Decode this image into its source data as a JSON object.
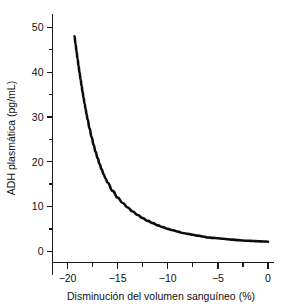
{
  "chart_data": {
    "type": "line",
    "title": "",
    "xlabel": "Disminución del volumen sanguíneo (%)",
    "ylabel": "ADH plasmática (pg/mL)",
    "xlim": [
      -21.5,
      0.6
    ],
    "ylim": [
      -2.5,
      53
    ],
    "grid": false,
    "legend": null,
    "xticks": [
      -20,
      -15,
      -10,
      -5,
      0
    ],
    "xticklabels": [
      "−20",
      "−15",
      "−10",
      "−5",
      "0"
    ],
    "xminorticks": [
      -17.5,
      -12.5,
      -7.5,
      -2.5
    ],
    "yticks": [
      0,
      10,
      20,
      30,
      40,
      50
    ],
    "yticklabels": [
      "0",
      "10",
      "20",
      "30",
      "40",
      "50"
    ],
    "yminorticks": [
      5,
      15,
      25,
      35,
      45
    ],
    "series": [
      {
        "name": "ADH plasmática",
        "color": "#0d0d0d",
        "x": [
          -19.3,
          -19.2,
          -19.1,
          -19.0,
          -18.9,
          -18.8,
          -18.7,
          -18.6,
          -18.5,
          -18.4,
          -18.3,
          -18.2,
          -18.1,
          -18.0,
          -17.8,
          -17.6,
          -17.4,
          -17.2,
          -17.0,
          -16.8,
          -16.6,
          -16.4,
          -16.2,
          -16.0,
          -15.5,
          -15.0,
          -14.5,
          -14.0,
          -13.5,
          -13.0,
          -12.5,
          -12.0,
          -11.5,
          -11.0,
          -10.5,
          -10.0,
          -9.5,
          -9.0,
          -8.5,
          -8.0,
          -7.5,
          -7.0,
          -6.5,
          -6.0,
          -5.5,
          -5.0,
          -4.5,
          -4.0,
          -3.5,
          -3.0,
          -2.5,
          -2.0,
          -1.5,
          -1.0,
          -0.5,
          0.0
        ],
        "y": [
          48.0,
          46.3,
          44.6,
          43.0,
          41.4,
          39.9,
          38.4,
          37.0,
          35.6,
          34.3,
          33.0,
          31.8,
          30.6,
          29.5,
          27.4,
          25.5,
          23.8,
          22.2,
          20.8,
          19.5,
          18.3,
          17.2,
          16.2,
          15.3,
          13.5,
          12.0,
          10.8,
          9.8,
          8.9,
          8.1,
          7.4,
          6.8,
          6.3,
          5.8,
          5.4,
          5.0,
          4.7,
          4.4,
          4.1,
          3.9,
          3.7,
          3.5,
          3.3,
          3.1,
          3.0,
          2.9,
          2.8,
          2.7,
          2.6,
          2.5,
          2.4,
          2.35,
          2.3,
          2.25,
          2.2,
          2.15
        ]
      }
    ],
    "annotations": []
  },
  "axes": {
    "y_title": "ADH plasmática (pg/mL)",
    "x_title": "Disminución del volumen sanguíneo (%)"
  }
}
